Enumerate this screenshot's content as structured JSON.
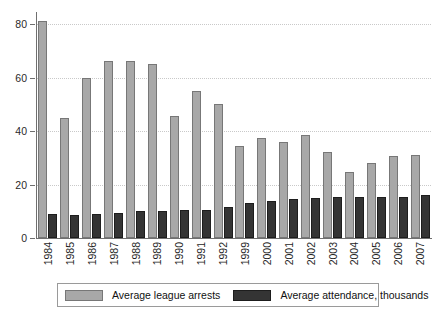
{
  "chart_data": {
    "type": "bar",
    "title": "",
    "subtitle": "",
    "xlabel": "",
    "ylabel": "",
    "ylim": [
      0,
      85
    ],
    "yticks": [
      0,
      20,
      40,
      60,
      80
    ],
    "ytick_labels": [
      "0",
      "20",
      "40",
      "60",
      "80"
    ],
    "grid": true,
    "legend_position": "bottom",
    "categories": [
      "1984",
      "1985",
      "1986",
      "1987",
      "1988",
      "1989",
      "1990",
      "1991",
      "1992",
      "1999",
      "2000",
      "2001",
      "2002",
      "2003",
      "2004",
      "2005",
      "2006",
      "2007"
    ],
    "series": [
      {
        "name": "Average league arrests",
        "color": "#a8a8a8",
        "values": [
          81,
          45,
          60,
          66,
          66,
          65,
          45.5,
          55,
          50,
          34.5,
          37.5,
          36,
          38.5,
          32,
          24.5,
          28,
          30.5,
          31
        ]
      },
      {
        "name": "Average attendance, thousands",
        "color": "#343434",
        "values": [
          9,
          8.5,
          9,
          9.5,
          10,
          10,
          10.5,
          10.5,
          11.5,
          13,
          14,
          14.5,
          15,
          15.5,
          15.5,
          15.5,
          15.5,
          16
        ]
      }
    ]
  },
  "legend": {
    "items": [
      {
        "label": "Average league arrests",
        "swatch": "light-gray-swatch"
      },
      {
        "label": "Average attendance, thousands",
        "swatch": "dark-gray-swatch"
      }
    ]
  }
}
